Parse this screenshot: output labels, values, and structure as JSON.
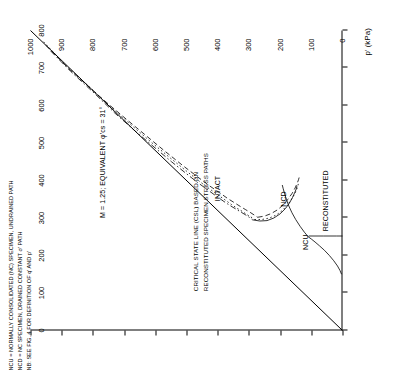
{
  "chart_data": {
    "type": "line",
    "title": "",
    "xlabel": "p' (kPa)",
    "ylabel": "q (kPa)",
    "xlim": [
      0,
      800
    ],
    "ylim": [
      0,
      1000
    ],
    "xticks": [
      0,
      100,
      200,
      300,
      400,
      500,
      600,
      700,
      800
    ],
    "yticks": [
      0,
      100,
      200,
      300,
      400,
      500,
      600,
      700,
      800,
      900,
      1000
    ],
    "grid": false,
    "legend": "none",
    "annotations": [
      {
        "key": "csl_label",
        "text": "M = 1.25; EQUIVALENT φ'cs = 31°"
      },
      {
        "key": "intact",
        "text": "INTACT"
      },
      {
        "key": "ncd",
        "text": "NCD"
      },
      {
        "key": "ncu",
        "text": "NCU"
      },
      {
        "key": "reconstituted",
        "text": "RECONSTITUTED"
      },
      {
        "key": "csl_block",
        "text": "CRITICAL STATE LINE (CSL) BASED ON"
      },
      {
        "key": "csl_block2",
        "text": "RECONSTITUTED SPECIMEN STRESS PATHS"
      },
      {
        "key": "note1",
        "text": "NCU = NORMALLY CONSOLIDATED (NC) SPECIMEN, UNDRAINED PATH"
      },
      {
        "key": "note2",
        "text": "NCD = NC SPECIMEN, DRAINED CONSTANT σ' PATH"
      },
      {
        "key": "note3",
        "text": "NB: SEE FIG. 4 FOR DEFINITION OF q' AND p'"
      }
    ],
    "series": [
      {
        "name": "csl",
        "style": "solid",
        "points": [
          [
            0,
            0
          ],
          [
            800,
            1000
          ]
        ]
      },
      {
        "name": "intact-undrained-1",
        "style": "dashed",
        "points": [
          [
            760,
            950
          ],
          [
            700,
            880
          ],
          [
            640,
            800
          ],
          [
            600,
            745
          ],
          [
            560,
            688
          ],
          [
            520,
            630
          ],
          [
            480,
            572
          ],
          [
            440,
            512
          ],
          [
            410,
            465
          ],
          [
            385,
            425
          ],
          [
            368,
            395
          ],
          [
            352,
            368
          ],
          [
            340,
            345
          ],
          [
            330,
            326
          ],
          [
            322,
            310
          ],
          [
            315,
            296
          ],
          [
            308,
            283
          ],
          [
            302,
            272
          ]
        ]
      },
      {
        "name": "intact-undrained-2",
        "style": "dotted",
        "points": [
          [
            770,
            958
          ],
          [
            710,
            890
          ],
          [
            650,
            812
          ],
          [
            600,
            748
          ],
          [
            550,
            680
          ],
          [
            500,
            610
          ],
          [
            460,
            552
          ],
          [
            425,
            500
          ],
          [
            400,
            462
          ],
          [
            380,
            430
          ],
          [
            362,
            400
          ],
          [
            348,
            376
          ],
          [
            336,
            356
          ],
          [
            326,
            338
          ],
          [
            318,
            322
          ],
          [
            310,
            308
          ],
          [
            303,
            294
          ],
          [
            296,
            282
          ]
        ]
      },
      {
        "name": "intact-undrained-3",
        "style": "dashdot",
        "points": [
          [
            745,
            935
          ],
          [
            690,
            870
          ],
          [
            630,
            792
          ],
          [
            580,
            730
          ],
          [
            530,
            662
          ],
          [
            485,
            598
          ],
          [
            450,
            548
          ],
          [
            420,
            503
          ],
          [
            395,
            465
          ],
          [
            375,
            432
          ],
          [
            358,
            404
          ],
          [
            344,
            380
          ],
          [
            333,
            360
          ],
          [
            324,
            342
          ],
          [
            316,
            326
          ],
          [
            309,
            312
          ],
          [
            302,
            299
          ],
          [
            295,
            288
          ]
        ]
      },
      {
        "name": "intact-drained-up-1",
        "style": "dashed",
        "points": [
          [
            302,
            272
          ],
          [
            305,
            250
          ],
          [
            312,
            228
          ],
          [
            322,
            208
          ],
          [
            335,
            190
          ],
          [
            350,
            175
          ],
          [
            365,
            162
          ],
          [
            380,
            152
          ],
          [
            393,
            145
          ],
          [
            402,
            141
          ],
          [
            408,
            139
          ]
        ]
      },
      {
        "name": "intact-drained-up-2",
        "style": "dotted",
        "points": [
          [
            296,
            282
          ],
          [
            296,
            258
          ],
          [
            300,
            234
          ],
          [
            308,
            212
          ],
          [
            320,
            193
          ],
          [
            334,
            177
          ],
          [
            349,
            164
          ],
          [
            363,
            154
          ],
          [
            376,
            147
          ],
          [
            386,
            143
          ],
          [
            393,
            141
          ]
        ]
      },
      {
        "name": "intact-drained-up-3",
        "style": "solid",
        "points": [
          [
            295,
            288
          ],
          [
            292,
            265
          ],
          [
            293,
            242
          ],
          [
            300,
            220
          ],
          [
            311,
            200
          ],
          [
            325,
            183
          ],
          [
            340,
            170
          ],
          [
            355,
            160
          ],
          [
            368,
            153
          ],
          [
            378,
            148
          ],
          [
            385,
            146
          ]
        ]
      },
      {
        "name": "ncd-path",
        "style": "solid",
        "points": [
          [
            250,
            110
          ],
          [
            262,
            122
          ],
          [
            278,
            136
          ],
          [
            296,
            150
          ],
          [
            314,
            162
          ],
          [
            332,
            172
          ],
          [
            350,
            180
          ],
          [
            366,
            186
          ],
          [
            378,
            190
          ],
          [
            388,
            193
          ]
        ]
      },
      {
        "name": "ncu-path",
        "style": "solid",
        "points": [
          [
            250,
            110
          ],
          [
            244,
            100
          ],
          [
            236,
            88
          ],
          [
            226,
            74
          ],
          [
            214,
            58
          ],
          [
            200,
            42
          ],
          [
            186,
            28
          ],
          [
            172,
            16
          ],
          [
            160,
            8
          ],
          [
            150,
            3
          ]
        ]
      },
      {
        "name": "reconstituted-path",
        "style": "solid",
        "points": [
          [
            252,
            108
          ],
          [
            252,
            60
          ],
          [
            252,
            20
          ],
          [
            252,
            0
          ]
        ]
      }
    ]
  },
  "axis": {
    "xlabel": "p' (kPa)",
    "xticklabels": [
      "0",
      "100",
      "200",
      "300",
      "400",
      "500",
      "600",
      "700",
      "800"
    ],
    "yticklabels": [
      "0",
      "100",
      "200",
      "300",
      "400",
      "500",
      "600",
      "700",
      "800",
      "900",
      "1000"
    ]
  }
}
